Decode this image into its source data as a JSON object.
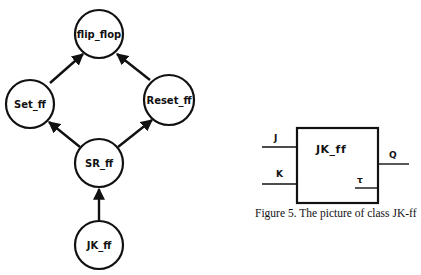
{
  "hierarchy_diagram": {
    "nodes": [
      {
        "id": "flip_flop",
        "label": "flip_flop",
        "cx": 99,
        "cy": 34,
        "r": 24
      },
      {
        "id": "set_ff",
        "label": "Set_ff",
        "cx": 30,
        "cy": 104,
        "r": 24
      },
      {
        "id": "reset_ff",
        "label": "Reset_ff",
        "cx": 169,
        "cy": 100,
        "r": 25
      },
      {
        "id": "sr_ff",
        "label": "SR_ff",
        "cx": 99,
        "cy": 163,
        "r": 24
      },
      {
        "id": "jk_ff",
        "label": "JK_ff",
        "cx": 99,
        "cy": 245,
        "r": 24
      }
    ],
    "edges": [
      {
        "from": "set_ff",
        "to": "flip_flop"
      },
      {
        "from": "reset_ff",
        "to": "flip_flop"
      },
      {
        "from": "sr_ff",
        "to": "set_ff"
      },
      {
        "from": "sr_ff",
        "to": "reset_ff"
      },
      {
        "from": "jk_ff",
        "to": "sr_ff"
      }
    ]
  },
  "jk_block": {
    "title": "JK_ff",
    "inputs": [
      {
        "label": "J"
      },
      {
        "label": "K"
      }
    ],
    "output": {
      "label": "Q"
    },
    "clock": {
      "label": "τ"
    }
  },
  "caption": "Figure 5. The picture of class JK-ff"
}
